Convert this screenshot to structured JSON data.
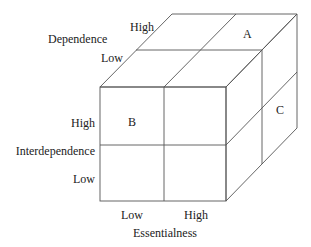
{
  "diagram": {
    "type": "3d-cube-matrix",
    "axes": {
      "dependence": {
        "title": "Dependence",
        "high": "High",
        "low": "Low"
      },
      "interdependence": {
        "title": "Interdependence",
        "high": "High",
        "low": "Low"
      },
      "essentialness": {
        "title": "Essentialness",
        "low": "Low",
        "high": "High"
      }
    },
    "cells": {
      "a": "A",
      "b": "B",
      "c": "C"
    },
    "stroke_color": "#555555"
  }
}
